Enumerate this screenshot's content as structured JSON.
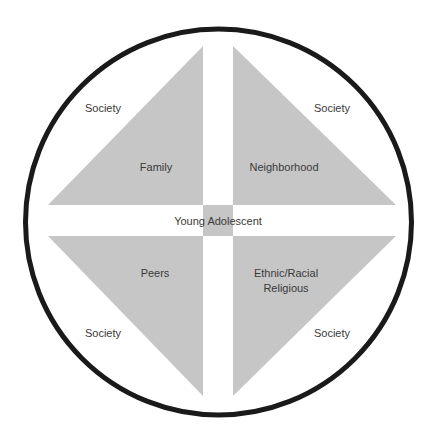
{
  "colors": {
    "background": "#ffffff",
    "circle_stroke": "#1a1a1a",
    "quadrant_fill": "#c6c6c6",
    "text": "#3a3a3a"
  },
  "diagram": {
    "center_label": "Young Adolescent",
    "quadrants": [
      {
        "position": "top-left",
        "label": "Family",
        "outer_label": "Society"
      },
      {
        "position": "top-right",
        "label": "Neighborhood",
        "outer_label": "Society"
      },
      {
        "position": "bottom-left",
        "label": "Peers",
        "outer_label": "Society"
      },
      {
        "position": "bottom-right",
        "label_line1": "Ethnic/Racial",
        "label_line2": "Religious",
        "outer_label": "Society"
      }
    ]
  }
}
